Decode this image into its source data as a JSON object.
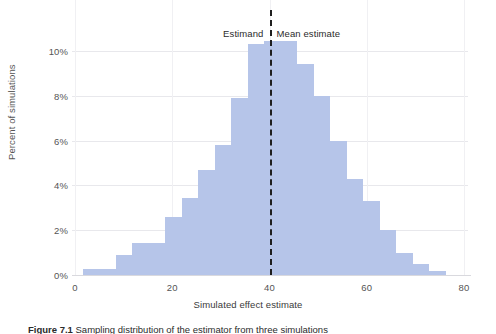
{
  "figure": {
    "caption_label": "Figure 7.1",
    "caption_text": "Sampling distribution of the estimator from three simulations"
  },
  "annotations": {
    "estimand_label": "Estimand",
    "mean_estimate_label": "Mean estimate"
  },
  "colors": {
    "bar_fill": "#b6c5e9",
    "reference_line": "#1f1f1f",
    "gridline": "#e8e8ec",
    "text": "#3a3a3a"
  },
  "chart_data": {
    "type": "bar",
    "title": "",
    "subtitle": "",
    "xlabel": "Simulated effect estimate",
    "ylabel": "Percent of simulations",
    "xlim": [
      0,
      80
    ],
    "ylim": [
      0,
      11.2
    ],
    "xticks": [
      0,
      20,
      40,
      60,
      80
    ],
    "xtick_labels": [
      "0",
      "20",
      "40",
      "60",
      "80"
    ],
    "yticks": [
      0,
      2,
      4,
      6,
      8,
      10
    ],
    "ytick_labels": [
      "0%",
      "2%",
      "4%",
      "6%",
      "8%",
      "10%"
    ],
    "grid": "horizontal",
    "legend": "none",
    "bin_width": 3.39,
    "bin_left_edges": [
      1.6,
      4.99,
      8.38,
      11.77,
      15.16,
      18.55,
      21.94,
      25.33,
      28.72,
      32.11,
      35.5,
      38.89,
      42.28,
      45.67,
      49.06,
      52.45,
      55.84,
      59.23,
      62.62,
      66.01,
      69.4,
      72.79
    ],
    "bin_centers": [
      3.3,
      6.7,
      10.1,
      13.5,
      16.9,
      20.3,
      23.6,
      27.0,
      30.4,
      33.8,
      37.2,
      40.6,
      44.0,
      47.4,
      50.8,
      54.1,
      57.5,
      60.9,
      64.3,
      67.7,
      71.1,
      74.5
    ],
    "values": [
      0.25,
      0.25,
      0.9,
      1.45,
      1.45,
      2.6,
      3.45,
      4.7,
      5.8,
      7.9,
      10.3,
      10.45,
      10.45,
      9.4,
      8.0,
      6.0,
      4.3,
      3.3,
      2.0,
      1.0,
      0.5,
      0.2
    ],
    "annotations": [
      {
        "label": "Estimand",
        "x": 40,
        "align": "right"
      },
      {
        "label": "Mean estimate",
        "x": 40,
        "align": "left"
      }
    ],
    "reference_lines": [
      {
        "x": 40,
        "style": "dashed",
        "color": "#1f1f1f",
        "label": "estimand / mean estimate"
      }
    ]
  }
}
